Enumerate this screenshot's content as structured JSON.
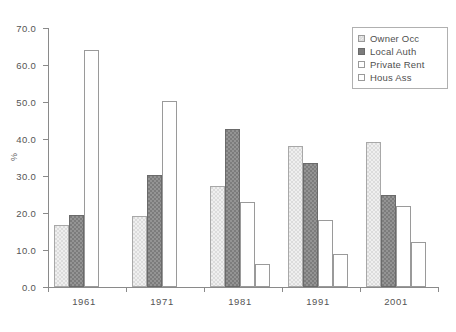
{
  "chart_data": {
    "type": "bar",
    "title": "",
    "subtitle": "",
    "xlabel": "",
    "ylabel": "%",
    "categories": [
      "1961",
      "1971",
      "1981",
      "1991",
      "2001"
    ],
    "series": [
      {
        "name": "Owner Occ",
        "values": [
          16.8,
          19.2,
          27.3,
          38.2,
          39.3
        ],
        "color": "#dcdcdc",
        "pattern": "light-hatch"
      },
      {
        "name": "Local Auth",
        "values": [
          19.5,
          30.2,
          42.7,
          33.4,
          25.0
        ],
        "color": "#7c7c7c",
        "pattern": "dark-hatch"
      },
      {
        "name": "Private Rent",
        "values": [
          64.0,
          50.3,
          23.0,
          18.2,
          22.0
        ],
        "color": "#ffffff",
        "pattern": "open"
      },
      {
        "name": "Hous Ass",
        "values": [
          0.0,
          0.0,
          6.2,
          9.0,
          12.2
        ],
        "color": "#ffffff",
        "pattern": "open"
      }
    ],
    "ylim": [
      0,
      70
    ],
    "ytick_step": 10,
    "ytick_labels": [
      "0.0",
      "10.0",
      "20.0",
      "30.0",
      "40.0",
      "50.0",
      "60.0",
      "70.0"
    ],
    "grid": false,
    "legend_position": "top-right",
    "legend_border": true,
    "axis_color": "#8a8a8a",
    "background": "#ffffff"
  }
}
